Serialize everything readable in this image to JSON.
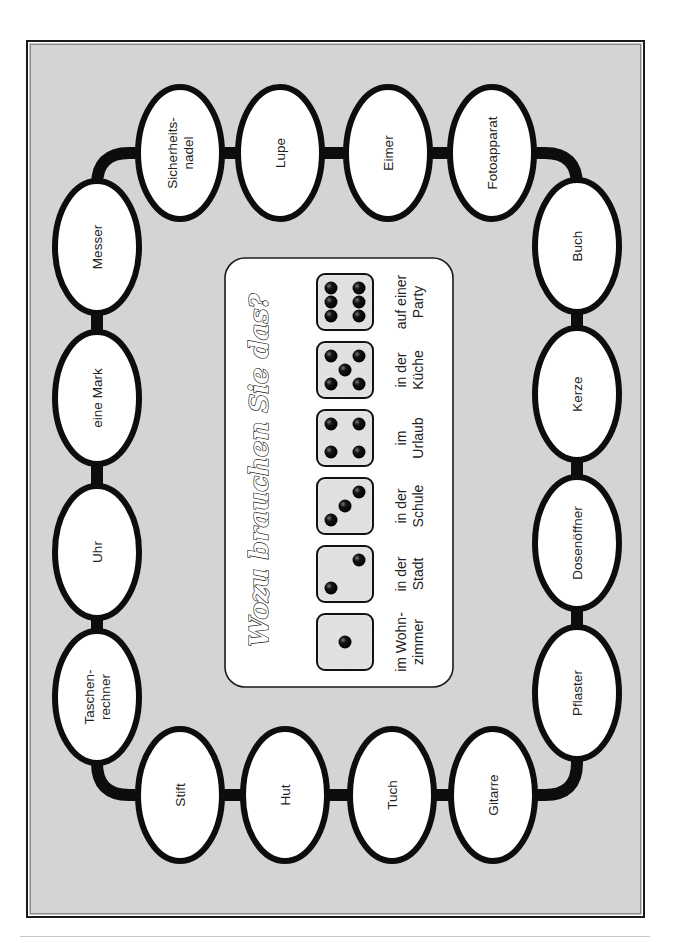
{
  "board": {
    "title": "Wozu brauchen Sie das?",
    "colors": {
      "background": "#d6d6d6",
      "frame": "#1a1a1a",
      "oval_fill": "#ffffff",
      "oval_stroke": "#0d0d0d",
      "die_fill": "#e6e6e6",
      "pip": "#111111"
    },
    "spaces": [
      {
        "label": "Sicherheits-\nnadel",
        "x": 180,
        "y": 153
      },
      {
        "label": "Lupe",
        "x": 280,
        "y": 153
      },
      {
        "label": "Eimer",
        "x": 388,
        "y": 153
      },
      {
        "label": "Fotoapparat",
        "x": 492,
        "y": 153
      },
      {
        "label": "Buch",
        "x": 577,
        "y": 246
      },
      {
        "label": "Kerze",
        "x": 577,
        "y": 394
      },
      {
        "label": "Dosenöffner",
        "x": 577,
        "y": 543
      },
      {
        "label": "Pflaster",
        "x": 577,
        "y": 693
      },
      {
        "label": "Gitarre",
        "x": 493,
        "y": 795
      },
      {
        "label": "Tuch",
        "x": 392,
        "y": 795
      },
      {
        "label": "Hut",
        "x": 285,
        "y": 795
      },
      {
        "label": "Stift",
        "x": 180,
        "y": 795
      },
      {
        "label": "Taschen-\nrechner",
        "x": 97,
        "y": 697
      },
      {
        "label": "Uhr",
        "x": 97,
        "y": 552
      },
      {
        "label": "eine Mark",
        "x": 97,
        "y": 398
      },
      {
        "label": "Messer",
        "x": 97,
        "y": 247
      }
    ],
    "dice": [
      {
        "value": 1,
        "label": "im Wohn-\nzimmer"
      },
      {
        "value": 2,
        "label": "in der\nStadt"
      },
      {
        "value": 3,
        "label": "in der\nSchule"
      },
      {
        "value": 4,
        "label": "im\nUrlaub"
      },
      {
        "value": 5,
        "label": "in der\nKüche"
      },
      {
        "value": 6,
        "label": "auf einer\nParty"
      }
    ]
  }
}
